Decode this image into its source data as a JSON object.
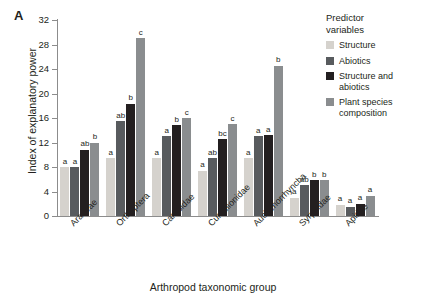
{
  "panel": {
    "letter": "A"
  },
  "axis": {
    "ylabel": "Index of explanatory power",
    "xlabel": "Arthropod taxonomic group",
    "yticks": [
      "0",
      "4",
      "8",
      "12",
      "16",
      "20",
      "24",
      "28",
      "32"
    ]
  },
  "legend": {
    "title_line1": "Predictor",
    "title_line2": "variables",
    "items": [
      {
        "label": "Structure",
        "color": "#d5d2cd"
      },
      {
        "label": "Abiotics",
        "color": "#585b5e"
      },
      {
        "label": "Structure and abiotics",
        "color": "#231f20"
      },
      {
        "label": "Plant species composition",
        "color": "#8a8d8f"
      }
    ]
  },
  "chart_data": {
    "type": "bar",
    "title": "",
    "xlabel": "Arthropod taxonomic group",
    "ylabel": "Index of explanatory power",
    "ylim": [
      0,
      32
    ],
    "ytick_step": 4,
    "grid": false,
    "legend_position": "right",
    "categories": [
      "Araneae",
      "Orthoptera",
      "Carabidae",
      "Curculionidae",
      "Auchenorrhyncha",
      "Syrphidae",
      "Apidae"
    ],
    "series": [
      {
        "name": "Structure",
        "color": "#d5d2cd",
        "values": [
          8.0,
          9.4,
          9.4,
          7.4,
          9.4,
          3.0,
          1.8
        ],
        "letters": [
          "a",
          "a",
          "a",
          "a",
          "a",
          "a",
          "a"
        ]
      },
      {
        "name": "Abiotics",
        "color": "#585b5e",
        "values": [
          8.0,
          15.5,
          13.0,
          9.4,
          13.0,
          5.0,
          1.5
        ],
        "letters": [
          "a",
          "ab",
          "a",
          "ab",
          "a",
          "ab",
          "a"
        ]
      },
      {
        "name": "Structure and abiotics",
        "color": "#231f20",
        "values": [
          10.8,
          18.3,
          14.8,
          12.5,
          13.2,
          5.8,
          2.0
        ],
        "letters": [
          "ab",
          "b",
          "b",
          "bc",
          "a",
          "b",
          "a"
        ]
      },
      {
        "name": "Plant species composition",
        "color": "#8a8d8f",
        "values": [
          12.0,
          29.0,
          16.0,
          15.0,
          24.5,
          5.8,
          3.3
        ],
        "letters": [
          "b",
          "c",
          "c",
          "c",
          "b",
          "b",
          "a"
        ]
      }
    ]
  }
}
